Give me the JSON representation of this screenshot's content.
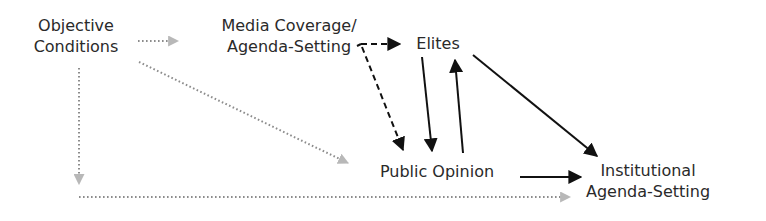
{
  "diagram": {
    "colors": {
      "dotted_arrow": "#b8b8b8",
      "dotted_line": "#8c8c8c",
      "solid": "#111111",
      "text": "#2a2a2a",
      "background": "#ffffff"
    },
    "nodes": {
      "objective_conditions": {
        "line1": "Objective",
        "line2": "Conditions"
      },
      "media_coverage": {
        "line1": "Media Coverage/",
        "line2": "Agenda-Setting"
      },
      "elites": {
        "line1": "Elites"
      },
      "public_opinion": {
        "line1": "Public Opinion"
      },
      "institutional": {
        "line1": "Institutional",
        "line2": "Agenda-Setting"
      }
    },
    "edges": [
      {
        "from": "Objective Conditions",
        "to": "Media Coverage/Agenda-Setting",
        "style": "dotted"
      },
      {
        "from": "Objective Conditions",
        "to": "Public Opinion",
        "style": "dotted"
      },
      {
        "from": "Objective Conditions",
        "to": "Institutional Agenda-Setting",
        "style": "dotted"
      },
      {
        "from": "Media Coverage/Agenda-Setting",
        "to": "Elites",
        "style": "dashed"
      },
      {
        "from": "Media Coverage/Agenda-Setting",
        "to": "Public Opinion",
        "style": "dashed"
      },
      {
        "from": "Elites",
        "to": "Public Opinion",
        "style": "solid"
      },
      {
        "from": "Public Opinion",
        "to": "Elites",
        "style": "solid"
      },
      {
        "from": "Elites",
        "to": "Institutional Agenda-Setting",
        "style": "solid"
      },
      {
        "from": "Public Opinion",
        "to": "Institutional Agenda-Setting",
        "style": "solid"
      }
    ]
  }
}
